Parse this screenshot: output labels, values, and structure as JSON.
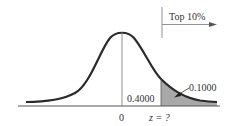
{
  "diagram": {
    "type": "normal-distribution",
    "labels": {
      "top_region": "Top 10%",
      "tail_area": "0.1000",
      "middle_area": "0.4000",
      "mean": "0",
      "z_value": "z = ?"
    },
    "colors": {
      "curve": "#2a2a2a",
      "shade": "#a8a8a8",
      "axis": "#555555"
    }
  }
}
